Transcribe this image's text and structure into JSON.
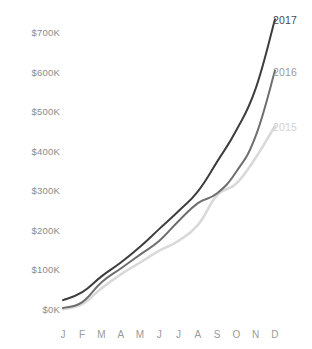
{
  "chart_data": {
    "type": "line",
    "title": "",
    "subtitle": "",
    "xlabel": "",
    "ylabel": "",
    "grid": false,
    "legend_position": "line-end-labels",
    "categories": [
      "J",
      "F",
      "M",
      "A",
      "M",
      "J",
      "J",
      "A",
      "S",
      "O",
      "N",
      "D"
    ],
    "x_tick_labels": [
      "J",
      "F",
      "M",
      "A",
      "M",
      "J",
      "J",
      "A",
      "S",
      "O",
      "N",
      "D"
    ],
    "y_tick_labels": [
      "$0K",
      "$100K",
      "$200K",
      "$300K",
      "$400K",
      "$500K",
      "$600K",
      "$700K"
    ],
    "y_tick_values": [
      0,
      100000,
      200000,
      300000,
      400000,
      500000,
      600000,
      700000
    ],
    "ylim": [
      0,
      760000
    ],
    "xlim": [
      0,
      11
    ],
    "series": [
      {
        "name": "2017",
        "label": "2017",
        "color": "#3d3d3d",
        "values": [
          25000,
          45000,
          85000,
          120000,
          160000,
          205000,
          250000,
          300000,
          375000,
          455000,
          560000,
          735000
        ]
      },
      {
        "name": "2016",
        "label": "2016",
        "color": "#6e6e6e",
        "values": [
          5000,
          20000,
          70000,
          105000,
          140000,
          175000,
          225000,
          270000,
          295000,
          350000,
          440000,
          605000
        ]
      },
      {
        "name": "2015",
        "label": "2015",
        "color": "#d9d9d9",
        "values": [
          2000,
          15000,
          55000,
          90000,
          120000,
          150000,
          175000,
          215000,
          290000,
          320000,
          385000,
          465000
        ]
      }
    ],
    "annotations": []
  },
  "axis": {
    "y_label_color": "#8a8a8a",
    "x_label_color": "#9a9a9a"
  },
  "series_labels": [
    {
      "text": "2017",
      "color": "#4a4a4a"
    },
    {
      "text": "2016",
      "color": "#9a9a9a"
    },
    {
      "text": "2015",
      "color": "#d2d2d2"
    }
  ]
}
